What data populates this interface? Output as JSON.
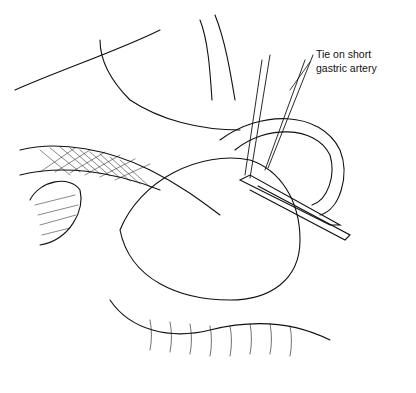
{
  "figure": {
    "label_line1": "Tie on short",
    "label_line2": "gastric artery"
  }
}
